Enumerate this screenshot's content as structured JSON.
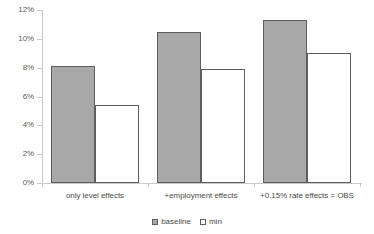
{
  "chart_data": {
    "type": "bar",
    "title": "",
    "subtitle": "",
    "xlabel": "",
    "ylabel": "",
    "ylim": [
      0,
      12
    ],
    "ytick_labels": [
      "12%",
      "10%",
      "8%",
      "6%",
      "4%",
      "2%",
      "0%"
    ],
    "ytick_values": [
      12,
      10,
      8,
      6,
      4,
      2,
      0
    ],
    "grid": false,
    "legend_position": "bottom",
    "categories": [
      "only level effects",
      "+employment effects",
      "+0.15% rate effects = OBS"
    ],
    "series": [
      {
        "name": "baseline",
        "color": "#a8a8a8",
        "values": [
          8.1,
          10.5,
          11.3
        ]
      },
      {
        "name": "min",
        "color": "#ffffff",
        "values": [
          5.4,
          7.9,
          9.0
        ]
      }
    ]
  },
  "legend": {
    "entries": [
      {
        "label": "baseline"
      },
      {
        "label": "min"
      }
    ]
  },
  "colors": {
    "baseline_fill": "#a8a8a8",
    "min_fill": "#ffffff",
    "bar_border": "#5e5e5e",
    "axis": "#c9c9c9",
    "text": "#4a4a4a",
    "background": "#ffffff"
  }
}
